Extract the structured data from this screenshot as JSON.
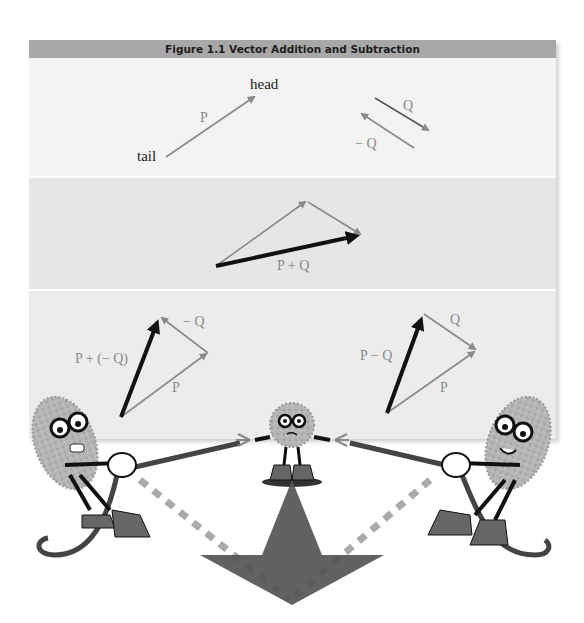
{
  "figure": {
    "title": "Figure 1.1   Vector Addition and Subtraction",
    "colors": {
      "header_bg": "#a8a8a8",
      "panel1_bg": "#f3f3f3",
      "panel2_bg": "#e6e6e6",
      "panel3_bg": "#ececec",
      "thin_vector": "#8a8a8a",
      "result_vector": "#111111",
      "big_arrow": "#555555"
    }
  },
  "panel1": {
    "tail_label": "tail",
    "head_label": "head",
    "p_label": "P",
    "q_label": "Q",
    "neg_q_label": "− Q"
  },
  "panel2": {
    "sum_label": "P + Q"
  },
  "panel3": {
    "left": {
      "result_label": "P + (− Q)",
      "neg_q_label": "− Q",
      "p_label": "P"
    },
    "right": {
      "result_label": "P − Q",
      "q_label": "Q",
      "p_label": "P"
    }
  },
  "illustration": {
    "characters": [
      "left-puller-character",
      "center-referee-character",
      "right-puller-character"
    ],
    "big_arrow": "resultant-down-arrow"
  }
}
